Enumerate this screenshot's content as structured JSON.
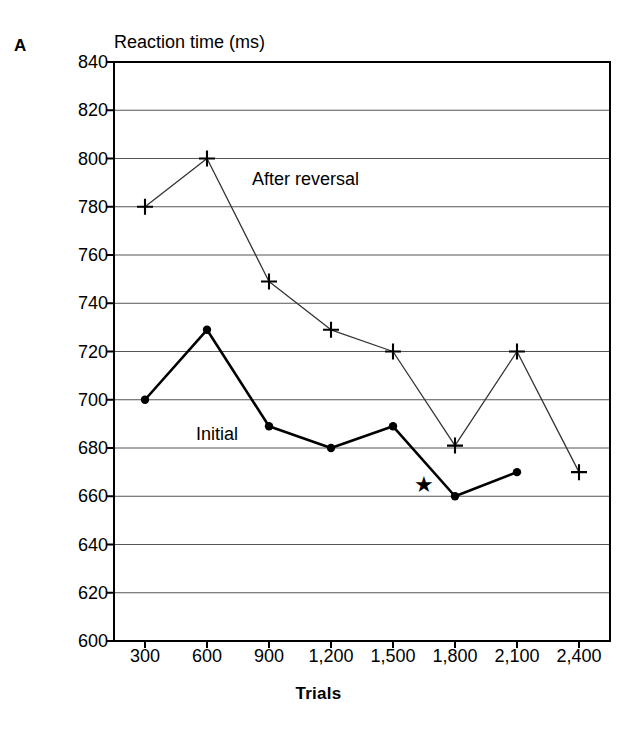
{
  "panel": {
    "label": "A"
  },
  "axes": {
    "y_title": "Reaction time (ms)",
    "x_title": "Trials"
  },
  "annotations": {
    "star": "★",
    "star_x": 1650,
    "star_y": 664
  },
  "chart_data": {
    "type": "line",
    "title": "Reaction time (ms)",
    "xlabel": "Trials",
    "ylabel": "Reaction time (ms)",
    "xlim": [
      150,
      2550
    ],
    "ylim": [
      600,
      840
    ],
    "ytick_step": 20,
    "grid": true,
    "grid_axis": "y",
    "legend_position": "inline-annotation",
    "categories": [
      300,
      600,
      900,
      1200,
      1500,
      1800,
      2100,
      2400
    ],
    "xtick_labels": [
      "300",
      "600",
      "900",
      "1,200",
      "1,500",
      "1,800",
      "2,100",
      "2,400"
    ],
    "ytick_labels": [
      "600",
      "620",
      "640",
      "660",
      "680",
      "700",
      "720",
      "740",
      "760",
      "780",
      "800",
      "820",
      "840"
    ],
    "ytick_values": [
      600,
      620,
      640,
      660,
      680,
      700,
      720,
      740,
      760,
      780,
      800,
      820,
      840
    ],
    "series": [
      {
        "name": "After reversal",
        "marker": "plus",
        "line_width": "thin",
        "color": "#333333",
        "x": [
          300,
          600,
          900,
          1200,
          1500,
          1800,
          2100,
          2400
        ],
        "values": [
          780,
          800,
          749,
          729,
          720,
          681,
          720,
          670
        ]
      },
      {
        "name": "Initial",
        "marker": "filled-circle",
        "line_width": "thick",
        "color": "#000000",
        "x": [
          300,
          600,
          900,
          1200,
          1500,
          1800,
          2100
        ],
        "values": [
          700,
          729,
          689,
          680,
          689,
          660,
          670
        ]
      }
    ]
  }
}
